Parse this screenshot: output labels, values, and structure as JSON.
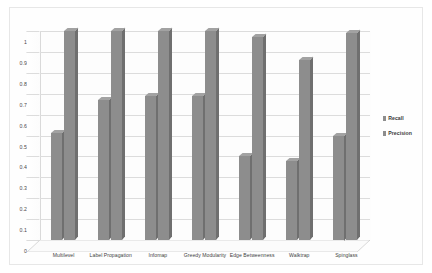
{
  "chart_data": {
    "type": "bar",
    "title": "",
    "subtitle": "",
    "xlabel": "",
    "ylabel": "",
    "ylim": [
      0,
      1
    ],
    "yticks": [
      "0",
      "0.1",
      "0.2",
      "0.3",
      "0.4",
      "0.5",
      "0.6",
      "0.7",
      "0.8",
      "0.9",
      "1"
    ],
    "ytick_values": [
      0,
      0.1,
      0.2,
      0.3,
      0.4,
      0.5,
      0.6,
      0.7,
      0.8,
      0.9,
      1
    ],
    "grid": true,
    "grid_axis": "y",
    "legend_position": "right",
    "style": "3d-clustered-column",
    "categories": [
      "Multilevel",
      "Label Propagation",
      "Infomap",
      "Greedy Modularity",
      "Edge Betweenness",
      "Walktrap",
      "Spinglass"
    ],
    "series": [
      {
        "name": "Recall",
        "color": "#8d8d8d",
        "values": [
          0.51,
          0.67,
          0.69,
          0.69,
          0.4,
          0.38,
          0.5
        ]
      },
      {
        "name": "Precision",
        "color": "#8d8d8d",
        "values": [
          1.0,
          1.0,
          1.0,
          1.0,
          0.97,
          0.86,
          0.99
        ]
      }
    ],
    "annotations": []
  },
  "legend": {
    "items": [
      {
        "label": "Recall",
        "swatch": "#8d8d8d"
      },
      {
        "label": "Precision",
        "swatch": "#8d8d8d"
      }
    ]
  },
  "colors": {
    "bar_front": "#8d8d8d",
    "bar_top": "#a2a2a2",
    "bar_side": "#6f6f6f",
    "gridline": "#dcdcdc",
    "frame": "#e7e7e7",
    "background": "#ffffff",
    "tick_text": "#4a4a4a"
  }
}
